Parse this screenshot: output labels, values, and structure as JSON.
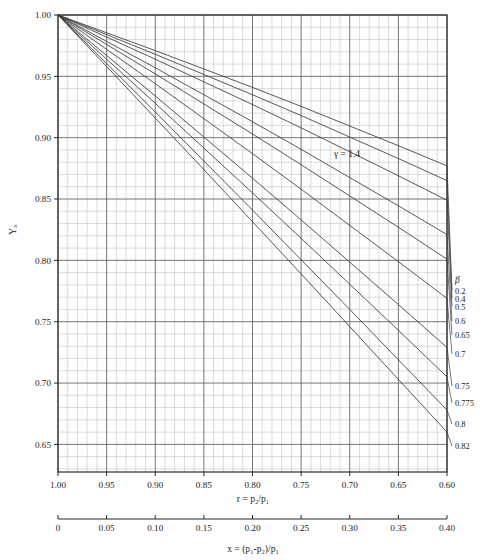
{
  "chart_data": {
    "type": "line",
    "title": "",
    "subtitle": "",
    "xlabel": "x = (p₁-p₂)/p₁",
    "xlabel_secondary": "r = p₂/p₁",
    "ylabel": "Yₐ",
    "grid": true,
    "legend_position": "right",
    "annotations": [
      {
        "text": "γ = 1.4",
        "x": 0.805,
        "y": 0.878
      }
    ],
    "axes": {
      "x_primary": {
        "name": "r = p₂/p₁",
        "ticks": [
          "1.00",
          "0.95",
          "0.90",
          "0.85",
          "0.80",
          "0.75",
          "0.70",
          "0.65",
          "0.60"
        ],
        "values": [
          1.0,
          0.95,
          0.9,
          0.85,
          0.8,
          0.75,
          0.7,
          0.65,
          0.6
        ],
        "range": [
          1.0,
          0.6
        ],
        "direction": "decreasing"
      },
      "x_secondary": {
        "name": "x = (p₁-p₂)/p₁",
        "ticks": [
          "0",
          "0.05",
          "0.10",
          "0.15",
          "0.20",
          "0.25",
          "0.30",
          "0.35",
          "0.40"
        ],
        "values": [
          0,
          0.05,
          0.1,
          0.15,
          0.2,
          0.25,
          0.3,
          0.35,
          0.4
        ],
        "range": [
          0,
          0.4
        ]
      },
      "y": {
        "name": "Yₐ",
        "ticks": [
          "1.00",
          "0.95",
          "0.90",
          "0.85",
          "0.80",
          "0.75",
          "0.70",
          "0.65"
        ],
        "values": [
          1.0,
          0.95,
          0.9,
          0.85,
          0.8,
          0.75,
          0.7,
          0.65
        ],
        "range": [
          0.6275,
          1.0
        ]
      }
    },
    "legend_title": "β",
    "series": [
      {
        "name": "0.2",
        "beta": 0.2,
        "label": "0.2",
        "x": [
          1.0,
          0.95,
          0.9,
          0.85,
          0.8,
          0.75,
          0.7,
          0.65,
          0.6
        ],
        "values": [
          1.0,
          0.9855,
          0.971,
          0.956,
          0.941,
          0.9255,
          0.9095,
          0.8935,
          0.877
        ]
      },
      {
        "name": "0.4",
        "beta": 0.4,
        "label": "0.4",
        "x": [
          1.0,
          0.95,
          0.9,
          0.85,
          0.8,
          0.75,
          0.7,
          0.65,
          0.6
        ],
        "values": [
          1.0,
          0.984,
          0.968,
          0.9515,
          0.935,
          0.918,
          0.9005,
          0.883,
          0.865
        ]
      },
      {
        "name": "0.5",
        "beta": 0.5,
        "label": "0.5",
        "x": [
          1.0,
          0.95,
          0.9,
          0.85,
          0.8,
          0.75,
          0.7,
          0.65,
          0.6
        ],
        "values": [
          1.0,
          0.982,
          0.964,
          0.9455,
          0.927,
          0.908,
          0.8885,
          0.869,
          0.849
        ]
      },
      {
        "name": "0.6",
        "beta": 0.6,
        "label": "0.6",
        "x": [
          1.0,
          0.95,
          0.9,
          0.85,
          0.8,
          0.75,
          0.7,
          0.65,
          0.6
        ],
        "values": [
          1.0,
          0.9785,
          0.957,
          0.935,
          0.913,
          0.8905,
          0.8675,
          0.8445,
          0.821
        ]
      },
      {
        "name": "0.65",
        "beta": 0.65,
        "label": "0.65",
        "x": [
          1.0,
          0.95,
          0.9,
          0.85,
          0.8,
          0.75,
          0.7,
          0.65,
          0.6
        ],
        "values": [
          1.0,
          0.976,
          0.952,
          0.9275,
          0.903,
          0.878,
          0.8525,
          0.827,
          0.801
        ]
      },
      {
        "name": "0.7",
        "beta": 0.7,
        "label": "0.7",
        "x": [
          1.0,
          0.95,
          0.9,
          0.85,
          0.8,
          0.75,
          0.7,
          0.65,
          0.6
        ],
        "values": [
          1.0,
          0.972,
          0.944,
          0.9155,
          0.887,
          0.858,
          0.8285,
          0.799,
          0.769
        ]
      },
      {
        "name": "0.75",
        "beta": 0.75,
        "label": "0.75",
        "x": [
          1.0,
          0.95,
          0.9,
          0.85,
          0.8,
          0.75,
          0.7,
          0.65,
          0.6
        ],
        "values": [
          1.0,
          0.967,
          0.934,
          0.9005,
          0.867,
          0.833,
          0.7985,
          0.764,
          0.729
        ]
      },
      {
        "name": "0.775",
        "beta": 0.775,
        "label": "0.775",
        "x": [
          1.0,
          0.95,
          0.9,
          0.85,
          0.8,
          0.75,
          0.7,
          0.65,
          0.6
        ],
        "values": [
          1.0,
          0.964,
          0.928,
          0.8915,
          0.855,
          0.818,
          0.7805,
          0.743,
          0.705
        ]
      },
      {
        "name": "0.8",
        "beta": 0.8,
        "label": "0.8",
        "x": [
          1.0,
          0.95,
          0.9,
          0.85,
          0.8,
          0.75,
          0.7,
          0.65,
          0.6
        ],
        "values": [
          1.0,
          0.9605,
          0.921,
          0.881,
          0.841,
          0.8005,
          0.76,
          0.719,
          0.678
        ]
      },
      {
        "name": "0.82",
        "beta": 0.82,
        "label": "0.82",
        "x": [
          1.0,
          0.95,
          0.9,
          0.85,
          0.8,
          0.75,
          0.7,
          0.65,
          0.6
        ],
        "values": [
          1.0,
          0.958,
          0.916,
          0.874,
          0.8315,
          0.789,
          0.746,
          0.703,
          0.66
        ]
      }
    ]
  },
  "colors": {
    "curve": "#3a3a3a",
    "grid_minor": "#b8b8b8",
    "grid_major": "#6e6e6e",
    "frame": "#2a2a2a",
    "text": "#1c1c1c",
    "background": "#ffffff"
  }
}
